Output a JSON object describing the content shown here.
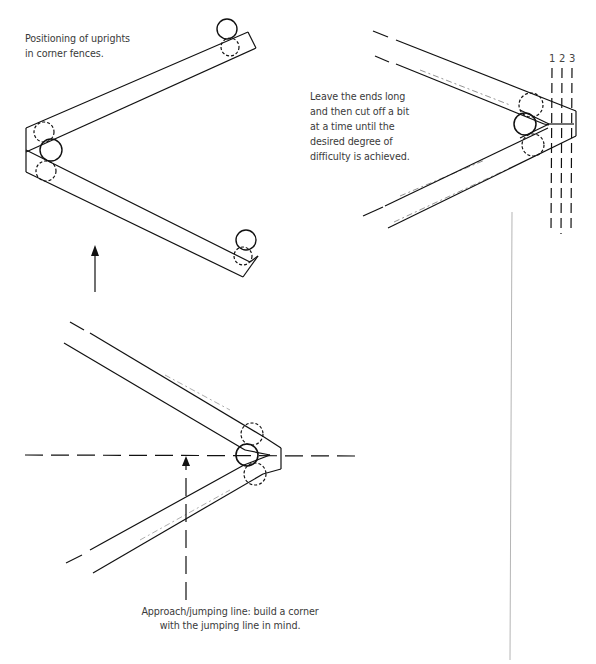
{
  "figure": {
    "caption_top_left": [
      "Positioning of uprights",
      "in corner fences."
    ],
    "caption_top_right": [
      "Leave the ends long",
      "and then cut off a bit",
      "at a time until the",
      "desired degree of",
      "difficulty is achieved."
    ],
    "caption_bottom": [
      "Approach/jumping line: build a corner",
      "with the jumping line in mind."
    ],
    "cut_lines": [
      "1",
      "2",
      "3"
    ]
  },
  "colors": {
    "line": "#111111",
    "text": "#3a3a3a",
    "background": "#ffffff",
    "margin_rule": "#b5b5b5"
  }
}
